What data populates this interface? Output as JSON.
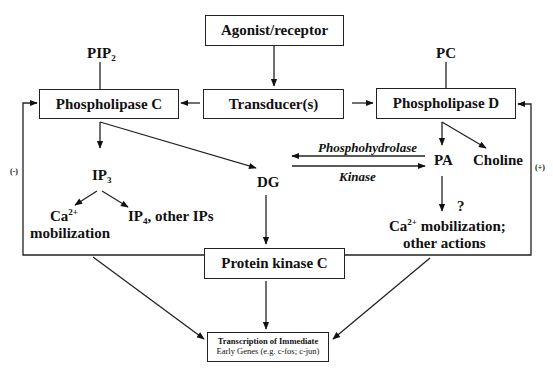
{
  "boxes": {
    "agonist": "Agonist/receptor",
    "transducer": "Transducer(s)",
    "plc": "Phospholipase C",
    "pld": "Phospholipase D",
    "pkc": "Protein kinase C",
    "transcription_line1": "Transcription of Immediate",
    "transcription_line2": "Early Genes (e.g. c-fos; c-jun)"
  },
  "labels": {
    "pip": "PIP",
    "pip_sub": "2",
    "pc": "PC",
    "ip": "IP",
    "ip_sub": "3",
    "dg": "DG",
    "pa": "PA",
    "choline": "Choline",
    "ca": "Ca",
    "ca_sup": "2+",
    "mobilization": "mobilization",
    "ip4": "IP",
    "ip4_sub": "4",
    "ip4_rest": ", other IPs",
    "question": "?",
    "pa_ca": "Ca",
    "pa_ca_sup": "2+",
    "pa_ca_rest": " mobilization;",
    "other_actions": "other actions",
    "phosphohydrolase": "Phosphohydrolase",
    "kinase": "Kinase",
    "feedback_neg": "(-)",
    "feedback_pos": "(+)"
  }
}
